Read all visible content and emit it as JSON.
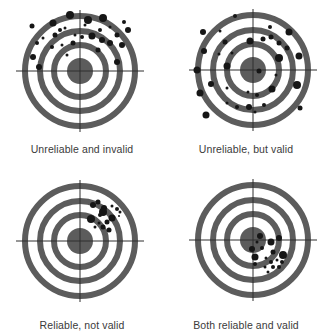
{
  "diagram": {
    "style": {
      "background": "#ffffff",
      "ring_color": "#5c5c5c",
      "bull_color": "#5c5c5c",
      "crosshair_color": "#2e2e2e",
      "dot_color": "#161616",
      "label_color": "#3a3a3a"
    },
    "target_geometry": {
      "rings": [
        {
          "radius": 55,
          "width": 6
        },
        {
          "radius": 40,
          "width": 6
        },
        {
          "radius": 26,
          "width": 6
        }
      ],
      "bull_radius": 13,
      "crosshair_half_length_x": 64,
      "crosshair_half_length_y": 61
    },
    "targets": [
      {
        "id": "unreliable-invalid",
        "label": "Unreliable and invalid",
        "panel": {
          "x": 0,
          "y": 0
        },
        "center": {
          "x": 80,
          "y": 71
        },
        "label_y": 143,
        "dots": [
          [
            70,
            15,
            4
          ],
          [
            88,
            20,
            4
          ],
          [
            103,
            18,
            4
          ],
          [
            53,
            23,
            3.5
          ],
          [
            32,
            26,
            2.5
          ],
          [
            124,
            22,
            2
          ],
          [
            128,
            30,
            3
          ],
          [
            100,
            30,
            2
          ],
          [
            92,
            36,
            3.5
          ],
          [
            102,
            40,
            3
          ],
          [
            110,
            43,
            3
          ],
          [
            122,
            45,
            3
          ],
          [
            117,
            35,
            2.5
          ],
          [
            82,
            37,
            2
          ],
          [
            73,
            43,
            2.5
          ],
          [
            55,
            35,
            2.5
          ],
          [
            43,
            38,
            1.5
          ],
          [
            37,
            43,
            2
          ],
          [
            52,
            47,
            2
          ],
          [
            62,
            45,
            1.5
          ],
          [
            67,
            55,
            1.5
          ],
          [
            33,
            57,
            3
          ],
          [
            98,
            50,
            2.5
          ],
          [
            117,
            62,
            3
          ],
          [
            39,
            67,
            3
          ],
          [
            85,
            25,
            1.5
          ],
          [
            65,
            28,
            1.5
          ],
          [
            75,
            35,
            1.5
          ],
          [
            60,
            30,
            2
          ],
          [
            110,
            27,
            1.5
          ]
        ]
      },
      {
        "id": "unreliable-valid",
        "label": "Unreliable, but valid",
        "panel": {
          "x": 164,
          "y": 0
        },
        "center": {
          "x": 253,
          "y": 70
        },
        "label_y": 143,
        "dots": [
          [
            235,
            16,
            2
          ],
          [
            203,
            32,
            3
          ],
          [
            220,
            31,
            1.5
          ],
          [
            270,
            27,
            2
          ],
          [
            289,
            32,
            3.5
          ],
          [
            225,
            42,
            2.5
          ],
          [
            250,
            41,
            3.5
          ],
          [
            263,
            39,
            2.5
          ],
          [
            271,
            37,
            2.5
          ],
          [
            279,
            43,
            2.5
          ],
          [
            287,
            48,
            2.5
          ],
          [
            204,
            51,
            3
          ],
          [
            232,
            53,
            1.5
          ],
          [
            219,
            54,
            1.5
          ],
          [
            279,
            58,
            4
          ],
          [
            299,
            56,
            3.5
          ],
          [
            227,
            66,
            3.5
          ],
          [
            197,
            70,
            3.5
          ],
          [
            259,
            71,
            2.5
          ],
          [
            276,
            75,
            1.5
          ],
          [
            211,
            84,
            3
          ],
          [
            297,
            85,
            4
          ],
          [
            227,
            88,
            1.5
          ],
          [
            272,
            89,
            3.5
          ],
          [
            200,
            93,
            3.5
          ],
          [
            248,
            92,
            1.5
          ],
          [
            257,
            95,
            2
          ],
          [
            227,
            103,
            1.5
          ],
          [
            237,
            107,
            2
          ],
          [
            249,
            107,
            3
          ],
          [
            264,
            105,
            2
          ],
          [
            255,
            112,
            1.5
          ],
          [
            300,
            108,
            2.5
          ],
          [
            206,
            115,
            3.5
          ]
        ]
      },
      {
        "id": "reliable-not-valid",
        "label": "Reliable, not valid",
        "panel": {
          "x": 0,
          "y": 167
        },
        "center": {
          "x": 80,
          "y": 241
        },
        "label_y": 152,
        "dots": [
          [
            93,
            205,
            3
          ],
          [
            98,
            202,
            2.5
          ],
          [
            104,
            208,
            3
          ],
          [
            112,
            206,
            1.5
          ],
          [
            117,
            209,
            2
          ],
          [
            91,
            219,
            4
          ],
          [
            100,
            215,
            2
          ],
          [
            103,
            212,
            4
          ],
          [
            112,
            218,
            3.5
          ],
          [
            107,
            222,
            2.5
          ],
          [
            99,
            223,
            1.5
          ],
          [
            103,
            227,
            2.5
          ],
          [
            109,
            230,
            2.5
          ],
          [
            95,
            227,
            1.5
          ],
          [
            120,
            212,
            1.5
          ],
          [
            119,
            216,
            1
          ]
        ]
      },
      {
        "id": "reliable-valid",
        "label": "Both reliable and valid",
        "panel": {
          "x": 164,
          "y": 167
        },
        "center": {
          "x": 253,
          "y": 240
        },
        "label_y": 152,
        "dots": [
          [
            260,
            236,
            3
          ],
          [
            279,
            238,
            3
          ],
          [
            257,
            242,
            1.5
          ],
          [
            271,
            242,
            3.5
          ],
          [
            252,
            249,
            3
          ],
          [
            262,
            248,
            2
          ],
          [
            273,
            252,
            2.5
          ],
          [
            255,
            257,
            3.5
          ],
          [
            283,
            255,
            4
          ],
          [
            266,
            258,
            1.5
          ],
          [
            277,
            260,
            1.5
          ],
          [
            271,
            262,
            2
          ],
          [
            282,
            262,
            2
          ],
          [
            255,
            264,
            2
          ],
          [
            265,
            267,
            1.5
          ],
          [
            273,
            267,
            2
          ],
          [
            279,
            267,
            2
          ],
          [
            268,
            272,
            1.5
          ]
        ]
      }
    ]
  }
}
